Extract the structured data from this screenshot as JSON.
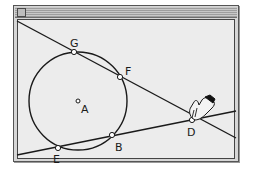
{
  "window": {
    "title": ""
  },
  "figure": {
    "circle": {
      "center_label": "A"
    },
    "points": [
      {
        "id": "G",
        "label": "G"
      },
      {
        "id": "F",
        "label": "F"
      },
      {
        "id": "D",
        "label": "D"
      },
      {
        "id": "B",
        "label": "B"
      },
      {
        "id": "E",
        "label": "E"
      },
      {
        "id": "A",
        "label": "A"
      }
    ],
    "lines": [
      {
        "name": "secant-GFD",
        "through": [
          "G",
          "F",
          "D"
        ]
      },
      {
        "name": "secant-EBD",
        "through": [
          "E",
          "B",
          "D"
        ]
      }
    ],
    "cursor": "hand-pointer-icon"
  },
  "colors": {
    "stroke": "#1a1a1a",
    "point_fill": "#ffffff",
    "canvas_bg": "#ececec"
  }
}
